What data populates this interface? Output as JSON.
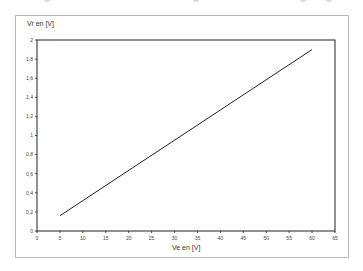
{
  "chart_data": {
    "type": "line",
    "title": "",
    "xlabel": "Ve en [V]",
    "ylabel": "Vr en [V]",
    "xlim": [
      0,
      65
    ],
    "ylim": [
      0,
      2
    ],
    "x_ticks": [
      "0",
      "5",
      "10",
      "15",
      "20",
      "25",
      "30",
      "35",
      "40",
      "45",
      "50",
      "55",
      "60",
      "65"
    ],
    "y_ticks": [
      "0",
      "0,2",
      "0,4",
      "0,6",
      "0,8",
      "1",
      "1,2",
      "1,4",
      "1,6",
      "1,8",
      "2"
    ],
    "grid": false,
    "legend": null,
    "series": [
      {
        "name": "Vr",
        "x": [
          5,
          60
        ],
        "y": [
          0.16,
          1.9
        ]
      }
    ]
  },
  "plot": {
    "line_color": "#222222",
    "axis_color": "#222222",
    "frame_color": "#b8b8b8"
  }
}
